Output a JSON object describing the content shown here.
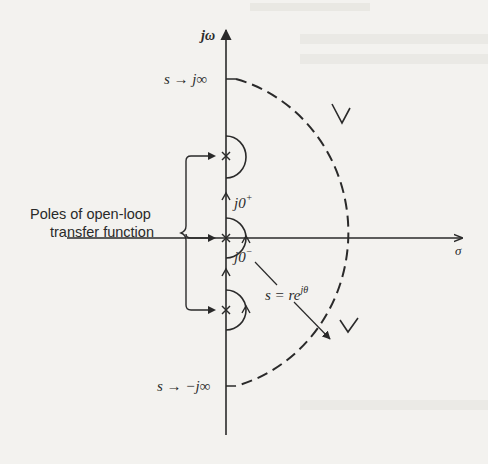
{
  "figure": {
    "axes": {
      "vertical_label": "jω",
      "horizontal_label": "σ"
    },
    "labels": {
      "top_infinity": "s → j∞",
      "bottom_infinity": "s → −j∞",
      "j0_plus": "j0",
      "j0_plus_sup": "+",
      "j0_minus": "j0",
      "j0_minus_sup": "−",
      "small_arc": "s = re",
      "small_arc_sup": "jθ",
      "poles_line1": "Poles of open-loop",
      "poles_line2": "transfer function"
    },
    "poles": [
      {
        "name": "upper-imaginary-pole",
        "position": "jω1"
      },
      {
        "name": "origin-pole",
        "position": "0"
      },
      {
        "name": "lower-imaginary-pole",
        "position": "−jω1"
      }
    ],
    "colors": {
      "ink": "#2a2a2a",
      "paper": "#f3f2ef"
    }
  }
}
